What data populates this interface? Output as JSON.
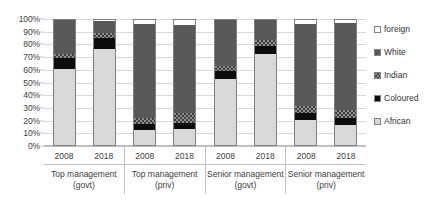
{
  "chart_data": {
    "type": "bar",
    "subtype": "stacked-100-percent",
    "title": "",
    "xlabel": "",
    "ylabel": "",
    "ylim": [
      0,
      100
    ],
    "ytick_labels": [
      "100%",
      "90%",
      "80%",
      "70%",
      "60%",
      "50%",
      "40%",
      "30%",
      "20%",
      "10%",
      "0%"
    ],
    "ytick_values": [
      100,
      90,
      80,
      70,
      60,
      50,
      40,
      30,
      20,
      10,
      0
    ],
    "grid": true,
    "legend_position": "right",
    "legend": [
      "foreign",
      "White",
      "Indian",
      "Coloured",
      "African"
    ],
    "groups": [
      {
        "name": "Top management",
        "qualifier": "(govt)",
        "years": [
          "2008",
          "2018"
        ]
      },
      {
        "name": "Top management",
        "qualifier": "(priv)",
        "years": [
          "2008",
          "2018"
        ]
      },
      {
        "name": "Senior management",
        "qualifier": "(govt)",
        "years": [
          "2008",
          "2018"
        ]
      },
      {
        "name": "Senior management",
        "qualifier": "(priv)",
        "years": [
          "2008",
          "2018"
        ]
      }
    ],
    "categories": [
      "Top management (govt) 2008",
      "Top management (govt) 2018",
      "Top management (priv) 2008",
      "Top management (priv) 2018",
      "Senior management (govt) 2008",
      "Senior management (govt) 2018",
      "Senior management (priv) 2008",
      "Senior management (priv) 2018"
    ],
    "series": [
      {
        "name": "African",
        "color": "#d9d9d9",
        "values": [
          61,
          77,
          12,
          13,
          53,
          73,
          20,
          16
        ]
      },
      {
        "name": "Coloured",
        "color": "#0d0d0d",
        "values": [
          9,
          9,
          5,
          5,
          6,
          6,
          6,
          6
        ]
      },
      {
        "name": "Indian",
        "color": "#8c8c8c",
        "values": [
          3,
          4,
          5,
          8,
          4,
          5,
          5,
          6
        ]
      },
      {
        "name": "White",
        "color": "#595959",
        "values": [
          27,
          9,
          75,
          70,
          37,
          16,
          66,
          70
        ]
      },
      {
        "name": "foreign",
        "color": "#ffffff",
        "values": [
          0,
          1,
          3,
          4,
          0,
          0,
          3,
          2
        ]
      }
    ],
    "bars": [
      {
        "african": 61,
        "coloured": 9,
        "indian": 3,
        "white": 27,
        "foreign": 0
      },
      {
        "african": 77,
        "coloured": 9,
        "indian": 4,
        "white": 9,
        "foreign": 1
      },
      {
        "african": 12,
        "coloured": 5,
        "indian": 5,
        "white": 75,
        "foreign": 3
      },
      {
        "african": 13,
        "coloured": 5,
        "indian": 8,
        "white": 70,
        "foreign": 4
      },
      {
        "african": 53,
        "coloured": 6,
        "indian": 4,
        "white": 37,
        "foreign": 0
      },
      {
        "african": 73,
        "coloured": 6,
        "indian": 5,
        "white": 16,
        "foreign": 0
      },
      {
        "african": 20,
        "coloured": 6,
        "indian": 5,
        "white": 66,
        "foreign": 3
      },
      {
        "african": 16,
        "coloured": 6,
        "indian": 6,
        "white": 70,
        "foreign": 2
      }
    ]
  }
}
